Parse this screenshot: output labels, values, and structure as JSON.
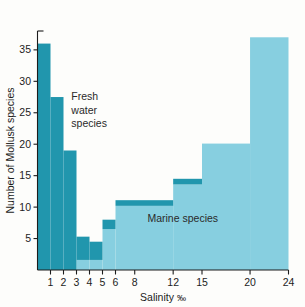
{
  "chart_data": {
    "type": "bar",
    "title": "",
    "subtitle": "",
    "xlabel": "Salinity",
    "xlabel_unit": "‰",
    "ylabel": "Number of Mollusk species",
    "xlim": [
      0,
      24
    ],
    "ylim": [
      0,
      38
    ],
    "grid": false,
    "legend": "none",
    "x_ticks": [
      1,
      2,
      3,
      4,
      5,
      6,
      8,
      12,
      15,
      20,
      24
    ],
    "x_tick_labels": [
      "1",
      "2",
      "3",
      "4",
      "5",
      "6",
      "8",
      "12",
      "15",
      "20",
      "24"
    ],
    "y_ticks": [
      5,
      10,
      15,
      20,
      25,
      30,
      35
    ],
    "y_tick_labels": [
      "5",
      "10",
      "15",
      "20",
      "25",
      "30",
      "35"
    ],
    "bins": [
      {
        "x0": 0,
        "x1": 1,
        "total": 36.0,
        "freshwater": 36.0,
        "marine": 0.0
      },
      {
        "x0": 1,
        "x1": 2,
        "total": 27.5,
        "freshwater": 27.5,
        "marine": 0.0
      },
      {
        "x0": 2,
        "x1": 3,
        "total": 19.0,
        "freshwater": 19.0,
        "marine": 0.0
      },
      {
        "x0": 3,
        "x1": 4,
        "total": 5.3,
        "freshwater": 5.3,
        "marine": 1.6
      },
      {
        "x0": 4,
        "x1": 5,
        "total": 4.5,
        "freshwater": 4.5,
        "marine": 1.6
      },
      {
        "x0": 5,
        "x1": 6,
        "total": 8.0,
        "freshwater": 8.0,
        "marine": 6.5
      },
      {
        "x0": 6,
        "x1": 12,
        "total": 11.1,
        "freshwater": 11.1,
        "marine": 10.2
      },
      {
        "x0": 12,
        "x1": 15,
        "total": 14.5,
        "freshwater": 14.5,
        "marine": 13.6
      },
      {
        "x0": 15,
        "x1": 20,
        "total": 20.1,
        "freshwater": 0.0,
        "marine": 20.1
      },
      {
        "x0": 20,
        "x1": 24,
        "total": 37.0,
        "freshwater": 0.0,
        "marine": 37.0
      }
    ],
    "series": [
      {
        "name": "Fresh water species",
        "color": "#2196ad"
      },
      {
        "name": "Marine species",
        "color": "#87cfe0"
      }
    ],
    "annotations": [
      {
        "id": "freshwater",
        "lines": [
          "Fresh",
          "water",
          "species"
        ],
        "x": 2.6,
        "y": 27.0
      },
      {
        "id": "marine",
        "lines": [
          "Marine species"
        ],
        "x": 13.0,
        "y": 7.6
      }
    ],
    "colors": {
      "freshwater": "#2196ad",
      "marine": "#87cfe0",
      "axis": "#1c1c1c",
      "background": "#fdfdfb"
    }
  }
}
